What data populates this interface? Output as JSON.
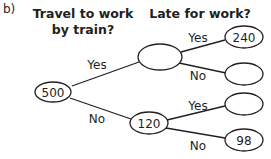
{
  "part_label": "b)",
  "headers": {
    "level1_line1": "Travel to work",
    "level1_line2": "by train?",
    "level2": "Late for work?"
  },
  "tree": {
    "root": {
      "value": "500"
    },
    "level1": [
      {
        "branch": "Yes",
        "value": ""
      },
      {
        "branch": "No",
        "value": "120"
      }
    ],
    "level2": [
      {
        "parent": "Yes",
        "branch": "Yes",
        "value": "240"
      },
      {
        "parent": "Yes",
        "branch": "No",
        "value": ""
      },
      {
        "parent": "No",
        "branch": "Yes",
        "value": ""
      },
      {
        "parent": "No",
        "branch": "No",
        "value": "98"
      }
    ]
  }
}
